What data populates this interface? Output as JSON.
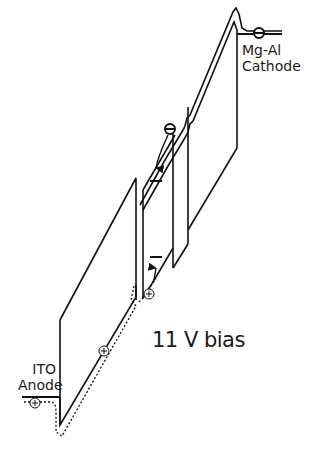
{
  "diagram": {
    "bias_label": "11 V bias",
    "anode": {
      "line1": "ITO",
      "line2": "Anode"
    },
    "cathode": {
      "line1": "Mg-Al",
      "line2": "Cathode"
    },
    "carriers": {
      "electron_symbol": "−",
      "hole_symbol": "+",
      "electrons": [
        {
          "name": "electron-at-cathode",
          "x": 259,
          "y": 33
        },
        {
          "name": "electron-in-etl",
          "x": 170,
          "y": 129
        }
      ],
      "holes": [
        {
          "name": "hole-at-anode",
          "x": 35,
          "y": 403
        },
        {
          "name": "hole-in-htl",
          "x": 104,
          "y": 351
        },
        {
          "name": "hole-at-interface",
          "x": 149,
          "y": 294
        }
      ]
    },
    "colors": {
      "line": "#111111",
      "background": "#ffffff",
      "text": "#1a1a1a"
    }
  }
}
